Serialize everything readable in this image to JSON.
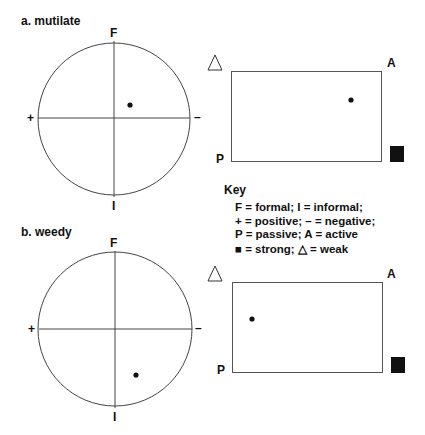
{
  "panels": [
    {
      "title": "a. mutilate",
      "circle": {
        "top_label": "F",
        "bottom_label": "I",
        "left_label": "+",
        "right_label": "–",
        "dot": {
          "x": 130,
          "y": 105
        }
      },
      "rect": {
        "top_right_label": "A",
        "bottom_left_label": "P",
        "weak_icon": "△",
        "strong_icon": "■",
        "dot": {
          "x": 351,
          "y": 100
        }
      }
    },
    {
      "title": "b. weedy",
      "circle": {
        "top_label": "F",
        "bottom_label": "I",
        "left_label": "+",
        "right_label": "–",
        "dot": {
          "x": 136,
          "y": 375
        }
      },
      "rect": {
        "top_right_label": "A",
        "bottom_left_label": "P",
        "weak_icon": "△",
        "strong_icon": "■",
        "dot": {
          "x": 252,
          "y": 319
        }
      }
    }
  ],
  "key": {
    "title": "Key",
    "lines": [
      "F = formal;  I = informal;",
      "+ = positive;  – = negative;",
      "P = passive;  A = active",
      "■ = strong; △ = weak"
    ]
  },
  "colors": {
    "line": "#444444",
    "ink": "#111111"
  }
}
